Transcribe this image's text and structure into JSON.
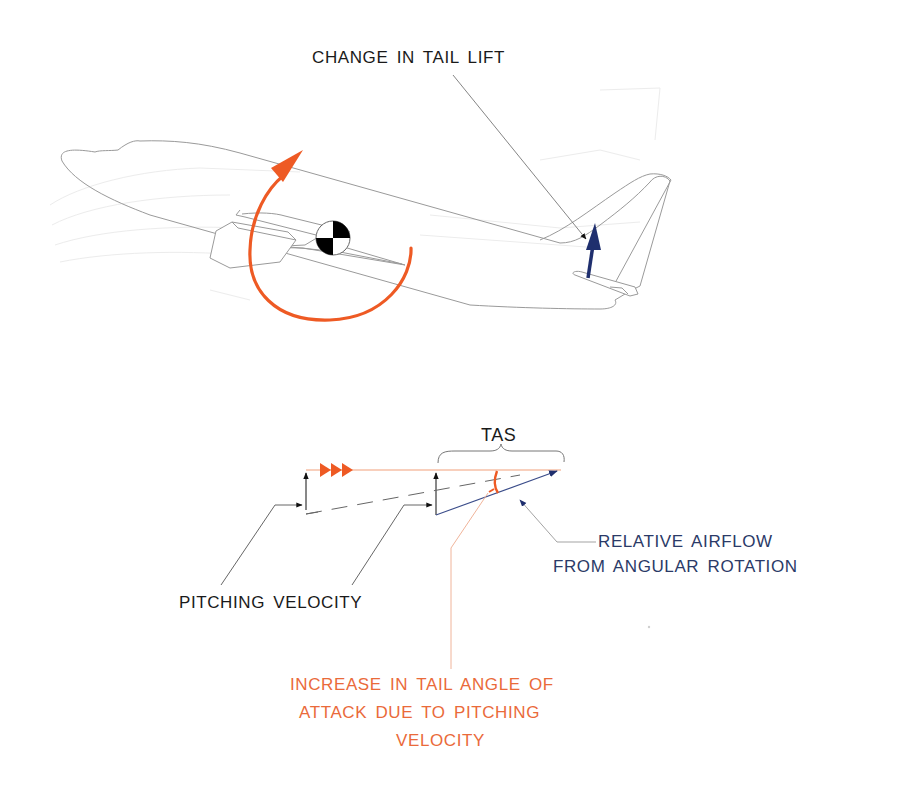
{
  "figure": {
    "colors": {
      "outline": "#9a9a9a",
      "outline_faint": "#e6e6e6",
      "rotation_arrow": "#ee5a24",
      "tail_lift_arrow": "#1f2f6e",
      "tas_line": "#f2a07a",
      "relative_airflow": "#3b4d8a",
      "leader_dark": "#555555",
      "leader_orange": "#f0b49a",
      "cg_black": "#000000"
    },
    "labels": {
      "change_in_tail_lift": "CHANGE IN TAIL LIFT",
      "tas": "TAS",
      "relative_airflow_line1": "RELATIVE AIRFLOW",
      "relative_airflow_line2": "FROM ANGULAR ROTATION",
      "pitching_velocity": "PITCHING VELOCITY",
      "aoa_increase_line1": "INCREASE IN TAIL ANGLE OF",
      "aoa_increase_line2": "ATTACK DUE TO PITCHING",
      "aoa_increase_line3": "VELOCITY"
    },
    "icons": {
      "cg_symbol": "center-of-gravity-icon",
      "rotation": "pitch-rotation-arrow-icon",
      "tail_lift": "lift-arrow-icon",
      "tas_direction": "triple-chevron-icon"
    }
  }
}
